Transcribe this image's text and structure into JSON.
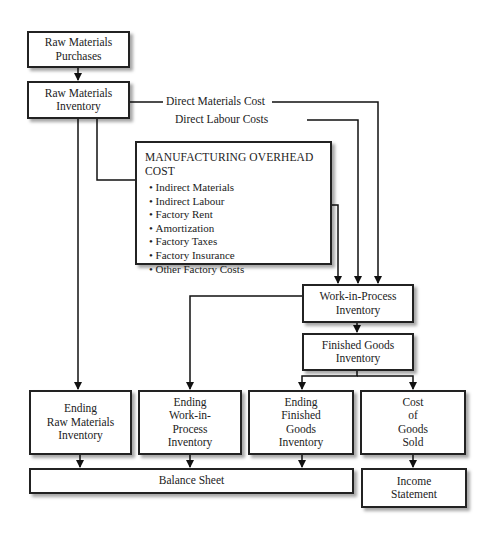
{
  "diagram": {
    "type": "cost-flow",
    "nodes": {
      "raw_materials_purchases": [
        "Raw Materials",
        "Purchases"
      ],
      "raw_materials_inventory": [
        "Raw Materials",
        "Inventory"
      ],
      "manufacturing_overhead": {
        "title": "MANUFACTURING OVERHEAD COST",
        "items": [
          "Indirect Materials",
          "Indirect Labour",
          "Factory Rent",
          "Amortization",
          "Factory Taxes",
          "Factory Insurance",
          "Other Factory Costs"
        ]
      },
      "work_in_process": [
        "Work-in-Process",
        "Inventory"
      ],
      "finished_goods": [
        "Finished Goods",
        "Inventory"
      ],
      "ending_raw_materials": [
        "Ending",
        "Raw Materials",
        "Inventory"
      ],
      "ending_wip": [
        "Ending",
        "Work-in-",
        "Process",
        "Inventory"
      ],
      "ending_finished_goods": [
        "Ending",
        "Finished",
        "Goods",
        "Inventory"
      ],
      "cost_of_goods_sold": [
        "Cost",
        "of",
        "Goods",
        "Sold"
      ],
      "balance_sheet": "Balance Sheet",
      "income_statement": [
        "Income",
        "Statement"
      ]
    },
    "edge_labels": {
      "direct_materials": "Direct Materials Cost",
      "direct_labour": "Direct Labour Costs"
    }
  }
}
